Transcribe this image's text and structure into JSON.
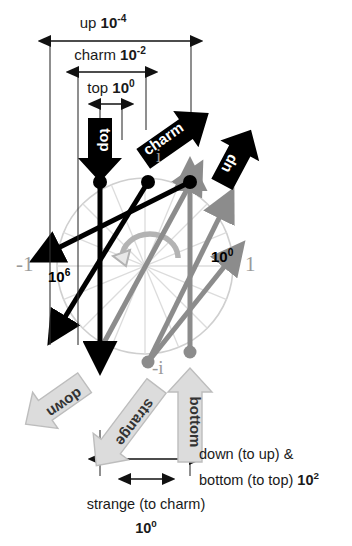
{
  "figure": {
    "type": "complex-plane-quark-diagram",
    "background": "#ffffff",
    "colors": {
      "black": "#000000",
      "gray_arrow": "#b0b0b0",
      "gray_vector": "#8c8c8c",
      "circle": "#cfcfcf",
      "spoke": "#d8d8d8",
      "axis_text": "#9a9a9a"
    }
  },
  "top_dimensions": [
    {
      "id": "up",
      "label": "up",
      "mantissa": "10",
      "exponent": "-4"
    },
    {
      "id": "charm",
      "label": "charm",
      "mantissa": "10",
      "exponent": "-2"
    },
    {
      "id": "top",
      "label": "top",
      "mantissa": "10",
      "exponent": "0"
    }
  ],
  "black_arrows": [
    {
      "id": "top",
      "label": "top"
    },
    {
      "id": "charm",
      "label": "charm"
    },
    {
      "id": "up",
      "label": "up"
    }
  ],
  "gray_arrows": [
    {
      "id": "down",
      "label": "down"
    },
    {
      "id": "strange",
      "label": "strange"
    },
    {
      "id": "bottom",
      "label": "bottom"
    }
  ],
  "axis_labels": {
    "left": "-1",
    "right": "1",
    "top": "i",
    "bottom": "-i"
  },
  "magnitudes": {
    "left": {
      "mantissa": "10",
      "exponent": "6"
    },
    "right": {
      "mantissa": "10",
      "exponent": "0"
    }
  },
  "bottom_dimensions": {
    "long": {
      "line1": "down (to up) &",
      "line2_prefix": "bottom (to top) ",
      "mantissa": "10",
      "exponent": "2"
    },
    "short": {
      "line1": "strange (to charm)",
      "mantissa": "10",
      "exponent": "0"
    }
  }
}
